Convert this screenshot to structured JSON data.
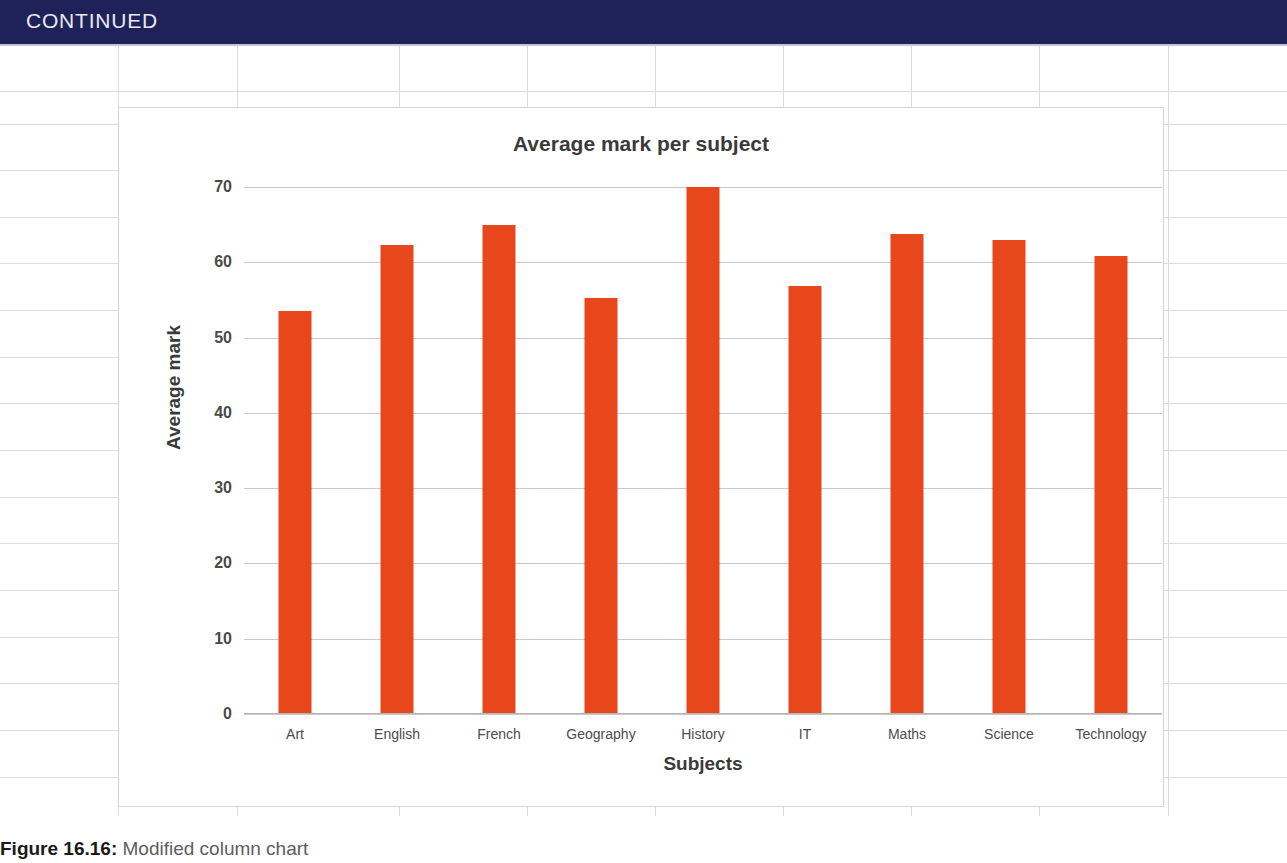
{
  "header": {
    "label": "CONTINUED",
    "background_color": "#1f2258",
    "text_color": "#e9e9f2"
  },
  "caption": {
    "number": "Figure 16.16:",
    "text": " Modified column chart"
  },
  "chart_data": {
    "type": "bar",
    "title": "Average mark per subject",
    "xlabel": "Subjects",
    "ylabel": "Average mark",
    "categories": [
      "Art",
      "English",
      "French",
      "Geography",
      "History",
      "IT",
      "Maths",
      "Science",
      "Technology"
    ],
    "values": [
      53.5,
      62.3,
      65.0,
      55.3,
      70.0,
      56.9,
      63.7,
      63.0,
      60.8
    ],
    "ylim": [
      0,
      70
    ],
    "yticks": [
      0,
      10,
      20,
      30,
      40,
      50,
      60,
      70
    ],
    "ytick_labels": [
      "0",
      "10",
      "20",
      "30",
      "40",
      "50",
      "60",
      "70"
    ],
    "grid": true,
    "legend": false,
    "bar_color": "#e8471c",
    "gridline_color": "#c8c8c8",
    "plot_background": "#ffffff"
  },
  "spreadsheet": {
    "background_color": "#ffffff",
    "gridline_color": "#dcdcdc",
    "column_line_x": [
      118,
      237,
      399,
      527,
      655,
      783,
      911,
      1039,
      1168
    ],
    "row_line_y": [
      44,
      91,
      124,
      170,
      217,
      263,
      310,
      357,
      403,
      450,
      497,
      543,
      590,
      637,
      683,
      730,
      777
    ]
  }
}
